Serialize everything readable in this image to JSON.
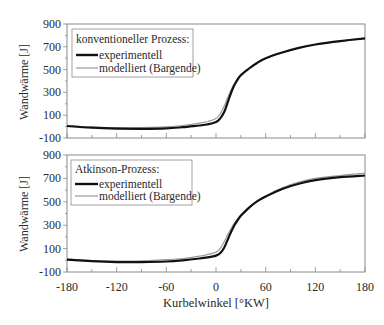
{
  "chart_data": [
    {
      "type": "line",
      "panel": "top",
      "title": "",
      "legend_title": "konventioneller Prozess:",
      "xlabel": "",
      "ylabel": "Wandwärme [J]",
      "xlim": [
        -180,
        180
      ],
      "ylim": [
        -100,
        900
      ],
      "yticks": [
        -100,
        100,
        300,
        500,
        700,
        900
      ],
      "xticks": [
        -180,
        -120,
        -60,
        0,
        60,
        120,
        180
      ],
      "x_tick_labels_shown": false,
      "grid": false,
      "legend_position": "upper-left",
      "x": [
        -180,
        -150,
        -120,
        -90,
        -60,
        -40,
        -20,
        -10,
        0,
        5,
        10,
        15,
        20,
        25,
        30,
        40,
        50,
        60,
        80,
        100,
        120,
        150,
        180
      ],
      "series": [
        {
          "name": "experimentell",
          "style": "thick-black",
          "values": [
            5,
            -10,
            -18,
            -20,
            -15,
            -5,
            10,
            20,
            40,
            70,
            130,
            230,
            330,
            400,
            450,
            510,
            560,
            600,
            650,
            690,
            720,
            750,
            775
          ]
        },
        {
          "name": "modelliert (Bargende)",
          "style": "thin-gray",
          "values": [
            10,
            -5,
            -10,
            -10,
            -2,
            10,
            30,
            45,
            70,
            110,
            180,
            270,
            350,
            410,
            455,
            515,
            560,
            598,
            648,
            688,
            718,
            748,
            775
          ]
        }
      ]
    },
    {
      "type": "line",
      "panel": "bottom",
      "title": "",
      "legend_title": "Atkinson-Prozess:",
      "xlabel": "Kurbelwinkel [°KW]",
      "ylabel": "Wandwärme [J]",
      "xlim": [
        -180,
        180
      ],
      "ylim": [
        -100,
        900
      ],
      "yticks": [
        -100,
        100,
        300,
        500,
        700,
        900
      ],
      "xticks": [
        -180,
        -120,
        -60,
        0,
        60,
        120,
        180
      ],
      "x_tick_labels_shown": true,
      "grid": false,
      "legend_position": "upper-left",
      "x": [
        -180,
        -150,
        -120,
        -90,
        -60,
        -40,
        -20,
        -10,
        0,
        5,
        10,
        15,
        20,
        25,
        30,
        40,
        50,
        60,
        80,
        100,
        120,
        150,
        180
      ],
      "series": [
        {
          "name": "experimentell",
          "style": "thick-black",
          "values": [
            5,
            -8,
            -15,
            -15,
            -10,
            0,
            15,
            25,
            40,
            60,
            110,
            190,
            270,
            330,
            380,
            450,
            505,
            545,
            610,
            655,
            685,
            710,
            725
          ]
        },
        {
          "name": "modelliert (Bargende)",
          "style": "thin-gray",
          "values": [
            10,
            -2,
            -8,
            -5,
            5,
            15,
            35,
            50,
            70,
            100,
            160,
            230,
            295,
            345,
            385,
            455,
            505,
            550,
            620,
            668,
            700,
            725,
            745
          ]
        }
      ]
    }
  ],
  "panels": [
    {
      "ylabel": "Wandwärme [J]",
      "legend_title": "konventioneller Prozess:",
      "legend_items": [
        "experimentell",
        "modelliert (Bargende)"
      ],
      "ytick_labels": [
        "900",
        "700",
        "500",
        "300",
        "100",
        "-100"
      ]
    },
    {
      "ylabel": "Wandwärme [J]",
      "legend_title": "Atkinson-Prozess:",
      "legend_items": [
        "experimentell",
        "modelliert (Bargende)"
      ],
      "ytick_labels": [
        "900",
        "700",
        "500",
        "300",
        "100",
        "-100"
      ]
    }
  ],
  "xaxis": {
    "label": "Kurbelwinkel [°KW]",
    "tick_labels": [
      "-180",
      "-120",
      "-60",
      "0",
      "60",
      "120",
      "180"
    ]
  },
  "colors": {
    "experimentell": "#111111",
    "modelliert": "#9a9a9a",
    "axis": "#8a8a8a",
    "text": "#2a2a2a"
  }
}
